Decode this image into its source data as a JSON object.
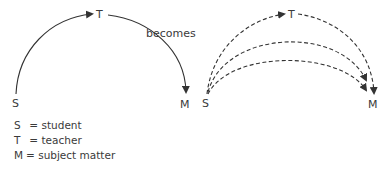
{
  "diagram": {
    "left": {
      "S": "S",
      "T": "T",
      "M": "M"
    },
    "connector_label": "becomes",
    "right": {
      "S": "S",
      "T": "T",
      "M": "M"
    }
  },
  "legend": [
    {
      "key": "S",
      "sep": "=",
      "value": "student"
    },
    {
      "key": "T",
      "sep": "=",
      "value": "teacher"
    },
    {
      "key": "M",
      "sep": "=",
      "value": "subject matter"
    }
  ]
}
